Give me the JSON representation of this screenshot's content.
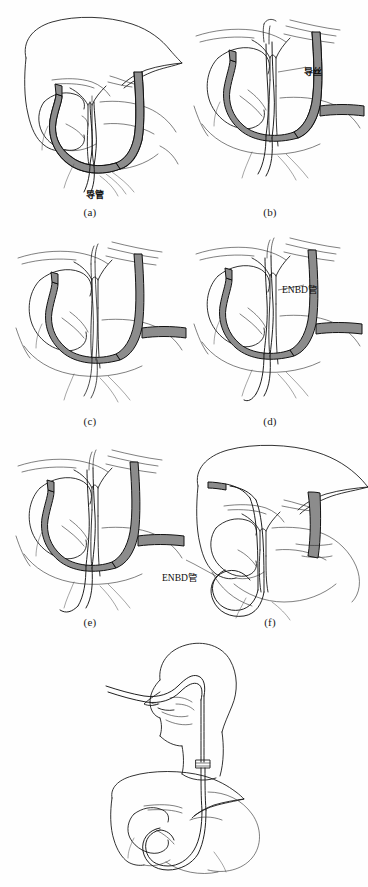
{
  "figure": {
    "title_text": "",
    "background_color": "#ffffff",
    "ink_color": "#1c1c1c",
    "scope_fill_color": "#8c8c8c",
    "width": 368,
    "height": 887
  },
  "panels": [
    {
      "id": "a",
      "caption": "(a)",
      "caption_x": 90,
      "caption_y": 212,
      "callouts": [
        {
          "text": "导管",
          "x": 88,
          "y": 192,
          "script": "cjk"
        }
      ],
      "anatomy": [
        "liver",
        "gallbladder",
        "common-bile-duct",
        "duodenum",
        "pancreas"
      ],
      "instruments": [
        "duodenoscope",
        "catheter"
      ]
    },
    {
      "id": "b",
      "caption": "(b)",
      "caption_x": 270,
      "caption_y": 212,
      "callouts": [
        {
          "text": "导丝",
          "x": 305,
          "y": 68,
          "script": "cjk"
        }
      ],
      "anatomy": [
        "gallbladder",
        "common-bile-duct",
        "duodenum"
      ],
      "instruments": [
        "duodenoscope",
        "catheter",
        "guidewire"
      ]
    },
    {
      "id": "c",
      "caption": "(c)",
      "caption_x": 90,
      "caption_y": 421,
      "callouts": [],
      "anatomy": [
        "gallbladder",
        "common-bile-duct",
        "duodenum"
      ],
      "instruments": [
        "duodenoscope",
        "guidewire"
      ]
    },
    {
      "id": "d",
      "caption": "(d)",
      "caption_x": 270,
      "caption_y": 421,
      "callouts": [
        {
          "text": "ENBD管",
          "x": 283,
          "y": 286,
          "script": "mix"
        }
      ],
      "anatomy": [
        "gallbladder",
        "common-bile-duct",
        "duodenum"
      ],
      "instruments": [
        "duodenoscope",
        "guidewire",
        "enbd-tube"
      ]
    },
    {
      "id": "e",
      "caption": "(e)",
      "caption_x": 90,
      "caption_y": 622,
      "callouts": [],
      "anatomy": [
        "gallbladder",
        "common-bile-duct",
        "duodenum"
      ],
      "instruments": [
        "duodenoscope",
        "enbd-tube"
      ]
    },
    {
      "id": "f",
      "caption": "(f)",
      "caption_x": 270,
      "caption_y": 622,
      "callouts": [
        {
          "text": "ENBD管",
          "x": 163,
          "y": 574,
          "script": "mix"
        }
      ],
      "anatomy": [
        "liver",
        "gallbladder",
        "common-bile-duct",
        "duodenum",
        "stomach"
      ],
      "instruments": [
        "enbd-tube"
      ]
    },
    {
      "id": "g",
      "caption": "",
      "caption_x": 184,
      "caption_y": 884,
      "callouts": [],
      "anatomy": [
        "head-neck-sagittal",
        "nasopharynx",
        "esophagus",
        "liver",
        "stomach",
        "duodenum"
      ],
      "instruments": [
        "enbd-tube-nasal-route"
      ]
    }
  ],
  "legend": {
    "catheter_label": "导管",
    "guidewire_label": "导丝",
    "enbd_tube_label": "ENBD管"
  }
}
